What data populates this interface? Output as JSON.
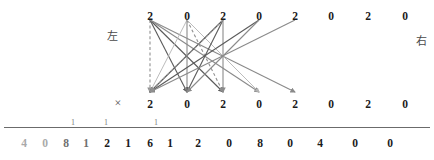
{
  "labels": {
    "left": "左",
    "right": "右",
    "multiply": "×"
  },
  "top_row": {
    "name": "multiplicand-row",
    "digits": [
      "2",
      "0",
      "2",
      "0",
      "2",
      "0",
      "2",
      "0"
    ],
    "x": [
      150,
      187,
      223,
      259,
      295,
      331,
      368,
      405
    ],
    "y": 10
  },
  "middle_row": {
    "name": "multiplier-row",
    "digits": [
      "2",
      "0",
      "2",
      "0",
      "2",
      "0",
      "2",
      "0"
    ],
    "x": [
      150,
      187,
      223,
      259,
      295,
      331,
      368,
      405
    ],
    "y": 98
  },
  "result_row": {
    "name": "product-row",
    "digits": [
      "4",
      "0",
      "8",
      "1",
      "2",
      "1",
      "6",
      "1",
      "2",
      "0",
      "8",
      "0",
      "4",
      "0",
      "0"
    ],
    "x": [
      24,
      45,
      66,
      86,
      107,
      128,
      150,
      170,
      198,
      229,
      260,
      290,
      320,
      355,
      390
    ],
    "y": 137,
    "shades": [
      "faded2",
      "faded2",
      "faded3",
      "faded3",
      "",
      "",
      "",
      "",
      "",
      "",
      "",
      "",
      "",
      "",
      ""
    ]
  },
  "carries": {
    "name": "carry-marks",
    "digits": [
      "1",
      "1",
      "1"
    ],
    "x": [
      73,
      106,
      156
    ],
    "y": 118
  },
  "colors": {
    "digit": "#1b1b1b",
    "carry": "#7c7c7c",
    "rule": "#6b6b6b",
    "wire_dark": "#5a5a5a",
    "wire_mid": "#8a8a8a",
    "wire_light": "#b4b4b4",
    "wire_dash": "#909090"
  },
  "wires": {
    "name": "partial-product-links",
    "top_y": 20,
    "bottom_y": 92,
    "edges": [
      {
        "from": 0,
        "to": 0,
        "style": "dashed",
        "shade": "wire_dash"
      },
      {
        "from": 0,
        "to": 1,
        "style": "solid",
        "shade": "wire_dark"
      },
      {
        "from": 0,
        "to": 2,
        "style": "solid",
        "shade": "wire_dark"
      },
      {
        "from": 0,
        "to": 3,
        "style": "solid",
        "shade": "wire_mid"
      },
      {
        "from": 0,
        "to": 4,
        "style": "solid",
        "shade": "wire_mid"
      },
      {
        "from": 1,
        "to": 0,
        "style": "solid",
        "shade": "wire_light"
      },
      {
        "from": 1,
        "to": 1,
        "style": "solid",
        "shade": "wire_mid"
      },
      {
        "from": 1,
        "to": 2,
        "style": "dashed",
        "shade": "wire_dash"
      },
      {
        "from": 1,
        "to": 3,
        "style": "solid",
        "shade": "wire_light"
      },
      {
        "from": 2,
        "to": 0,
        "style": "solid",
        "shade": "wire_dark"
      },
      {
        "from": 2,
        "to": 1,
        "style": "solid",
        "shade": "wire_dark"
      },
      {
        "from": 2,
        "to": 2,
        "style": "solid",
        "shade": "wire_mid"
      },
      {
        "from": 3,
        "to": 0,
        "style": "solid",
        "shade": "wire_dark"
      },
      {
        "from": 3,
        "to": 1,
        "style": "solid",
        "shade": "wire_mid"
      },
      {
        "from": 4,
        "to": 0,
        "style": "solid",
        "shade": "wire_mid"
      },
      {
        "from": 2,
        "to": 0,
        "style": "dashed",
        "shade": "wire_dash"
      }
    ]
  }
}
